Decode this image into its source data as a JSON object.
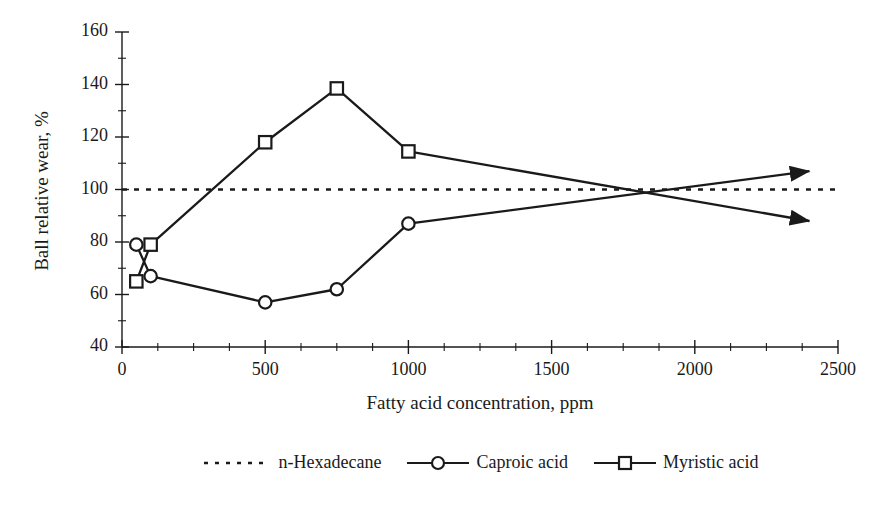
{
  "chart_data": {
    "type": "line",
    "title": "",
    "xlabel": "Fatty acid concentration, ppm",
    "ylabel": "Ball relative wear, %",
    "xlim": [
      0,
      2500
    ],
    "ylim": [
      40,
      160
    ],
    "xticks": [
      0,
      500,
      1000,
      1500,
      2000,
      2500
    ],
    "xtick_labels": [
      "0",
      "500",
      "1000",
      "1500",
      "2000",
      "2500"
    ],
    "yticks": [
      40,
      60,
      80,
      100,
      120,
      140,
      160
    ],
    "ytick_labels": [
      "40",
      "60",
      "80",
      "100",
      "120",
      "140",
      "160"
    ],
    "x_minor_tick_step": 125,
    "y_minor_tick_step": 10,
    "grid": false,
    "legend_position": "bottom",
    "series": [
      {
        "name": "n-Hexadecane",
        "style": "dotted",
        "marker": "none",
        "color": "#1a1a1a",
        "reference_value": 100,
        "x": [
          0,
          2500
        ],
        "y": [
          100,
          100
        ]
      },
      {
        "name": "Caproic acid",
        "style": "solid",
        "marker": "circle",
        "color": "#1a1a1a",
        "x": [
          50,
          100,
          500,
          750,
          1000
        ],
        "y": [
          79,
          67,
          57,
          62,
          87
        ],
        "extrapolation": {
          "arrow": true,
          "from_x": 1000,
          "from_y": 87,
          "to_x": 2400,
          "to_y": 107
        }
      },
      {
        "name": "Myristic acid",
        "style": "solid",
        "marker": "square",
        "color": "#1a1a1a",
        "x": [
          50,
          100,
          500,
          750,
          1000
        ],
        "y": [
          65,
          79,
          118,
          138.5,
          114.5
        ],
        "extrapolation": {
          "arrow": true,
          "from_x": 1000,
          "from_y": 114.5,
          "to_x": 2400,
          "to_y": 88
        }
      }
    ],
    "annotations": [
      {
        "text": "",
        "note": "Caproic acid and Myristic acid extrapolation lines cross near 1850 ppm at 100%"
      }
    ]
  },
  "legend": {
    "items": [
      {
        "label": "n-Hexadecane",
        "marker": "none",
        "style": "dotted"
      },
      {
        "label": "Caproic acid",
        "marker": "circle",
        "style": "solid"
      },
      {
        "label": "Myristic acid",
        "marker": "square",
        "style": "solid"
      }
    ]
  },
  "colors": {
    "ink": "#1a1a1a",
    "background": "#ffffff"
  }
}
